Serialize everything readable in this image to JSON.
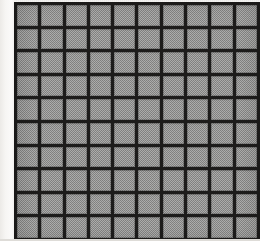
{
  "figure": {
    "title": "Halftone grid pattern",
    "width_px": 260,
    "height_px": 241
  },
  "grid": {
    "columns": 10,
    "rows": 10,
    "cell_pitch_px": 24,
    "line_width_px": 3,
    "plate_left_px": 14,
    "plate_top_px": 2,
    "plate_width_px": 246,
    "plate_height_px": 239,
    "bottom_row_clipped": true
  },
  "colors": {
    "page_background": "#f4f3f1",
    "paper_margin": "#fbfaf9",
    "grid_line": "#1d1c1b",
    "cell_fill": "#9e9e9c",
    "bottom_strip": "#dedcd8"
  },
  "cells": [
    [
      "r1c1",
      "r1c2",
      "r1c3",
      "r1c4",
      "r1c5",
      "r1c6",
      "r1c7",
      "r1c8",
      "r1c9",
      "r1c10"
    ],
    [
      "r2c1",
      "r2c2",
      "r2c3",
      "r2c4",
      "r2c5",
      "r2c6",
      "r2c7",
      "r2c8",
      "r2c9",
      "r2c10"
    ],
    [
      "r3c1",
      "r3c2",
      "r3c3",
      "r3c4",
      "r3c5",
      "r3c6",
      "r3c7",
      "r3c8",
      "r3c9",
      "r3c10"
    ],
    [
      "r4c1",
      "r4c2",
      "r4c3",
      "r4c4",
      "r4c5",
      "r4c6",
      "r4c7",
      "r4c8",
      "r4c9",
      "r4c10"
    ],
    [
      "r5c1",
      "r5c2",
      "r5c3",
      "r5c4",
      "r5c5",
      "r5c6",
      "r5c7",
      "r5c8",
      "r5c9",
      "r5c10"
    ],
    [
      "r6c1",
      "r6c2",
      "r6c3",
      "r6c4",
      "r6c5",
      "r6c6",
      "r6c7",
      "r6c8",
      "r6c9",
      "r6c10"
    ],
    [
      "r7c1",
      "r7c2",
      "r7c3",
      "r7c4",
      "r7c5",
      "r7c6",
      "r7c7",
      "r7c8",
      "r7c9",
      "r7c10"
    ],
    [
      "r8c1",
      "r8c2",
      "r8c3",
      "r8c4",
      "r8c5",
      "r8c6",
      "r8c7",
      "r8c8",
      "r8c9",
      "r8c10"
    ],
    [
      "r9c1",
      "r9c2",
      "r9c3",
      "r9c4",
      "r9c5",
      "r9c6",
      "r9c7",
      "r9c8",
      "r9c9",
      "r9c10"
    ],
    [
      "r10c1",
      "r10c2",
      "r10c3",
      "r10c4",
      "r10c5",
      "r10c6",
      "r10c7",
      "r10c8",
      "r10c9",
      "r10c10"
    ]
  ]
}
